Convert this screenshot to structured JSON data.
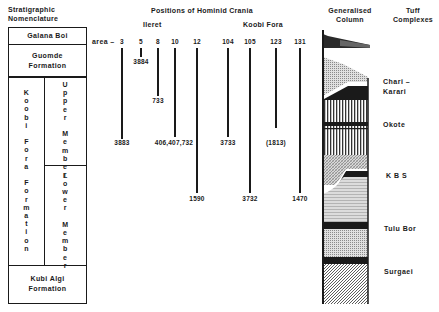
{
  "headers": {
    "strat_line1": "Stratigraphic",
    "strat_line2": "Nomenclature",
    "positions": "Positions of Hominid Crania",
    "ileret": "Ileret",
    "koobi_fora": "Koobi Fora",
    "column_line1": "Generalised",
    "column_line2": "Column",
    "tuff_line1": "Tuff",
    "tuff_line2": "Complexes"
  },
  "stratigraphy": {
    "galana_boi": "Galana Boi",
    "guomde_line1": "Guomde",
    "guomde_line2": "Formation",
    "koobi_fora_formation": [
      "K",
      "o",
      "o",
      "b",
      "i",
      "",
      "F",
      "o",
      "r",
      "a",
      "",
      "F",
      "o",
      "r",
      "m",
      "a",
      "t",
      "i",
      "o",
      "n"
    ],
    "upper_member": [
      "U",
      "p",
      "p",
      "e",
      "r",
      "",
      "M",
      "e",
      "m",
      "b",
      "e",
      "r"
    ],
    "lower_member": [
      "L",
      "o",
      "w",
      "e",
      "r",
      "",
      "M",
      "e",
      "m",
      "b",
      "e",
      "r"
    ],
    "kubi_algi_line1": "Kubi Algi",
    "kubi_algi_line2": "Formation"
  },
  "crania": {
    "area_prefix": "area –",
    "areas": [
      {
        "area": "3",
        "specimen": "3883"
      },
      {
        "area": "5",
        "specimen": "3884"
      },
      {
        "area": "8",
        "specimen": "733"
      },
      {
        "area": "10",
        "specimen": "406,407,732"
      },
      {
        "area": "12",
        "specimen": "1590"
      },
      {
        "area": "104",
        "specimen": "3733"
      },
      {
        "area": "105",
        "specimen": "3732"
      },
      {
        "area": "123",
        "specimen": "(1813)"
      },
      {
        "area": "131",
        "specimen": "1470"
      }
    ]
  },
  "tuffs": {
    "chari_line1": "Chari –",
    "chari_line2": "Karari",
    "okote": "Okote",
    "kbs": "K B S",
    "tulu_bor": "Tulu Bor",
    "surgaei": "Surgaei"
  }
}
